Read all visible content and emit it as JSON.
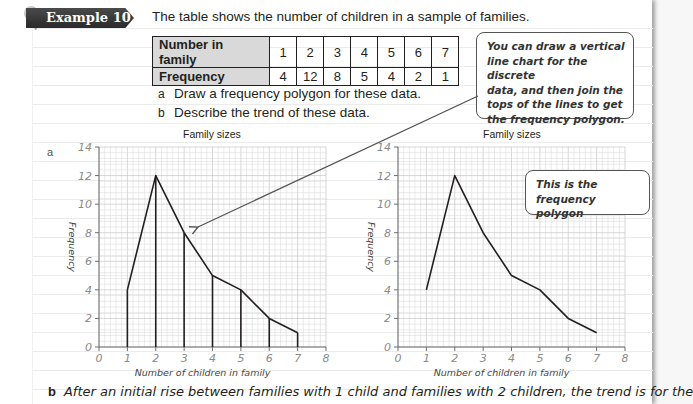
{
  "example": {
    "tag_label": "Example 10",
    "intro": "The table shows the number of children in a sample of families."
  },
  "table": {
    "row_headers": [
      "Number in family",
      "Frequency"
    ],
    "number_in_family": [
      "1",
      "2",
      "3",
      "4",
      "5",
      "6",
      "7"
    ],
    "frequency": [
      "4",
      "12",
      "8",
      "5",
      "4",
      "2",
      "1"
    ]
  },
  "questions": [
    {
      "label": "a",
      "text": "Draw a frequency polygon for these data."
    },
    {
      "label": "b",
      "text": "Describe the trend of these data."
    }
  ],
  "callouts": {
    "top": "You can draw a vertical line chart for the discrete data, and then join the tops of the lines to get the frequency polygon.",
    "top_lines": [
      "You can draw a vertical",
      "line chart for the discrete",
      "data, and then join the",
      "tops of the lines to get",
      "the frequency polygon."
    ],
    "right_lines": [
      "This is the frequency",
      "polygon"
    ]
  },
  "answer_a_label": "a",
  "answer_b": {
    "label": "b",
    "text": "After an initial rise between families with 1 child and families with 2 children, the trend is for the"
  },
  "colors": {
    "grid_minor": "#dcdcdc",
    "grid_major": "#bdbdbd",
    "axis": "#6d6e71",
    "line": "#231f20",
    "tag_bg": "#333333"
  },
  "chart_data": [
    {
      "type": "line",
      "variant": "vertical line chart with frequency polygon",
      "title": "Family sizes",
      "xlabel": "Number of children in family",
      "ylabel": "Frequency",
      "x": [
        1,
        2,
        3,
        4,
        5,
        6,
        7
      ],
      "values": [
        4,
        12,
        8,
        5,
        4,
        2,
        1
      ],
      "xlim": [
        0,
        8
      ],
      "ylim": [
        0,
        14
      ],
      "x_ticks": [
        "0",
        "1",
        "2",
        "3",
        "4",
        "5",
        "6",
        "7",
        "8"
      ],
      "y_ticks": [
        "0",
        "2",
        "4",
        "6",
        "8",
        "10",
        "12",
        "14"
      ],
      "grid": true,
      "vertical_lines": true
    },
    {
      "type": "line",
      "variant": "frequency polygon",
      "title": "Family sizes",
      "xlabel": "Number of children in family",
      "ylabel": "Frequency",
      "x": [
        1,
        2,
        3,
        4,
        5,
        6,
        7
      ],
      "values": [
        4,
        12,
        8,
        5,
        4,
        2,
        1
      ],
      "xlim": [
        0,
        8
      ],
      "ylim": [
        0,
        14
      ],
      "x_ticks": [
        "0",
        "1",
        "2",
        "3",
        "4",
        "5",
        "6",
        "7",
        "8"
      ],
      "y_ticks": [
        "0",
        "2",
        "4",
        "6",
        "8",
        "10",
        "12",
        "14"
      ],
      "grid": true,
      "vertical_lines": false
    }
  ]
}
